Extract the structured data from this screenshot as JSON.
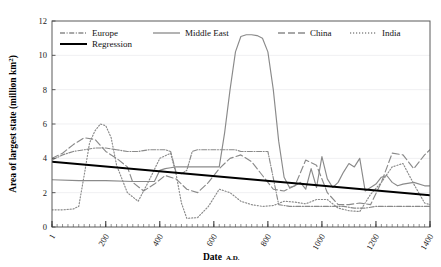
{
  "figure": {
    "title_fragment": "",
    "background": "#ffffff"
  },
  "axes": {
    "y_title_main": "Area of largest state (million km",
    "y_title_sup": "2",
    "y_title_close": ")",
    "x_title_main": "Date",
    "x_title_small": "A.D.",
    "y_ticks": [
      "0",
      "2",
      "4",
      "6",
      "8",
      "10",
      "12"
    ],
    "x_ticks": [
      "1",
      "200",
      "400",
      "600",
      "800",
      "1000",
      "1200",
      "1400"
    ]
  },
  "legend": {
    "items": [
      {
        "label": "Europe",
        "style": "dash-dot",
        "color": "#8a8a8a"
      },
      {
        "label": "Middle East",
        "style": "solid",
        "color": "#8a8a8a"
      },
      {
        "label": "China",
        "style": "long-dash",
        "color": "#8a8a8a"
      },
      {
        "label": "India",
        "style": "dotted",
        "color": "#8a8a8a"
      },
      {
        "label": "Regression",
        "style": "solid-thick",
        "color": "#000000"
      }
    ]
  },
  "chart_data": {
    "type": "line",
    "title": "",
    "xlabel": "Date A.D.",
    "ylabel": "Area of largest state (million km2)",
    "xlim": [
      1,
      1400
    ],
    "ylim": [
      0,
      12
    ],
    "xticks": [
      1,
      200,
      400,
      600,
      800,
      1000,
      1200,
      1400
    ],
    "yticks": [
      0,
      2,
      4,
      6,
      8,
      10,
      12
    ],
    "x_minor_tick_interval": 20,
    "grid": "horizontal-faint",
    "legend_position": "top-inside",
    "series": [
      {
        "name": "Europe",
        "style": "dash-dot",
        "color": "#8a8a8a",
        "x": [
          1,
          40,
          80,
          120,
          160,
          200,
          240,
          280,
          320,
          360,
          400,
          420,
          440,
          460,
          480,
          500,
          520,
          540,
          560,
          600,
          640,
          680,
          700,
          720,
          760,
          800,
          840,
          880,
          920,
          960,
          1000,
          1040,
          1080,
          1120,
          1160,
          1200,
          1240,
          1280,
          1320,
          1360,
          1400
        ],
        "y": [
          3.9,
          4.2,
          4.4,
          4.5,
          4.6,
          4.6,
          4.5,
          4.4,
          4.4,
          4.5,
          4.5,
          4.5,
          4.4,
          3.2,
          3.1,
          3.3,
          4.4,
          4.5,
          4.5,
          4.5,
          4.5,
          4.5,
          4.4,
          4.4,
          4.4,
          4.4,
          1.3,
          1.2,
          1.2,
          1.2,
          1.2,
          1.2,
          1.2,
          1.1,
          1.1,
          1.2,
          1.2,
          1.2,
          1.2,
          1.2,
          1.2
        ]
      },
      {
        "name": "Middle East",
        "style": "solid",
        "color": "#8a8a8a",
        "x": [
          1,
          100,
          200,
          300,
          380,
          400,
          420,
          440,
          460,
          480,
          500,
          540,
          580,
          600,
          620,
          640,
          660,
          680,
          700,
          720,
          740,
          760,
          780,
          800,
          820,
          840,
          860,
          880,
          900,
          920,
          940,
          960,
          980,
          1000,
          1020,
          1040,
          1060,
          1080,
          1100,
          1120,
          1140,
          1160,
          1180,
          1200,
          1220,
          1240,
          1260,
          1280,
          1300,
          1340,
          1380,
          1400
        ],
        "y": [
          2.75,
          2.7,
          2.7,
          2.65,
          2.65,
          3.3,
          3.4,
          3.45,
          3.5,
          3.5,
          3.5,
          3.5,
          3.5,
          3.5,
          3.5,
          5.5,
          8.0,
          10.2,
          11.1,
          11.2,
          11.2,
          11.15,
          11.0,
          10.2,
          8.0,
          5.0,
          2.9,
          2.3,
          2.4,
          2.6,
          2.2,
          3.4,
          2.3,
          4.1,
          2.8,
          2.3,
          2.6,
          3.2,
          3.7,
          3.5,
          4.0,
          2.1,
          2.3,
          2.5,
          2.9,
          3.0,
          2.6,
          2.4,
          2.5,
          2.6,
          2.4,
          2.4
        ]
      },
      {
        "name": "China",
        "style": "long-dash",
        "color": "#8a8a8a",
        "x": [
          1,
          40,
          80,
          120,
          160,
          200,
          240,
          280,
          300,
          340,
          380,
          420,
          460,
          500,
          540,
          580,
          620,
          660,
          700,
          740,
          780,
          820,
          860,
          900,
          940,
          980,
          1020,
          1060,
          1100,
          1140,
          1180,
          1220,
          1260,
          1300,
          1340,
          1380,
          1400
        ],
        "y": [
          4.0,
          4.3,
          4.8,
          5.2,
          5.1,
          4.4,
          4.0,
          3.5,
          2.6,
          2.1,
          2.5,
          3.0,
          2.8,
          2.2,
          2.0,
          2.6,
          3.4,
          4.0,
          4.2,
          3.8,
          3.0,
          2.2,
          2.1,
          2.4,
          3.9,
          3.6,
          2.0,
          1.3,
          1.3,
          1.4,
          1.3,
          2.6,
          4.3,
          4.2,
          3.4,
          4.2,
          4.5
        ]
      },
      {
        "name": "India",
        "style": "dotted",
        "color": "#8a8a8a",
        "x": [
          1,
          40,
          80,
          100,
          120,
          140,
          160,
          180,
          200,
          220,
          240,
          280,
          320,
          360,
          400,
          440,
          460,
          480,
          500,
          540,
          580,
          620,
          660,
          700,
          740,
          780,
          820,
          860,
          900,
          940,
          980,
          1020,
          1060,
          1100,
          1140,
          1180,
          1220,
          1260,
          1300,
          1340,
          1380,
          1400
        ],
        "y": [
          1.0,
          1.0,
          1.05,
          1.2,
          3.0,
          4.9,
          5.6,
          6.0,
          5.9,
          5.2,
          3.6,
          2.0,
          1.5,
          2.7,
          4.0,
          4.3,
          3.1,
          1.4,
          0.5,
          0.55,
          1.2,
          2.2,
          2.0,
          1.5,
          1.3,
          1.2,
          1.25,
          1.5,
          1.45,
          1.35,
          1.6,
          1.6,
          1.1,
          0.95,
          0.9,
          1.9,
          2.6,
          3.5,
          3.7,
          2.5,
          1.4,
          1.3
        ]
      },
      {
        "name": "Regression",
        "style": "solid-thick",
        "color": "#000000",
        "x": [
          1,
          1400
        ],
        "y": [
          3.8,
          1.85
        ]
      }
    ]
  }
}
